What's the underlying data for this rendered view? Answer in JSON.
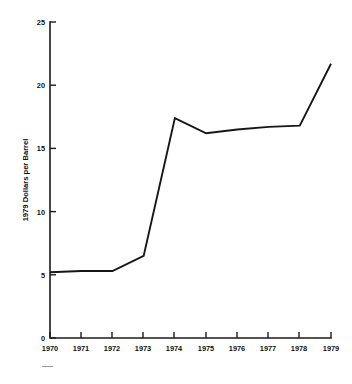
{
  "chart_data": {
    "type": "line",
    "title": "",
    "subtitle": "",
    "xlabel": "",
    "ylabel": "1979 Dollars per Barrel",
    "x": [
      1970,
      1971,
      1972,
      1973,
      1974,
      1975,
      1976,
      1977,
      1978,
      1979
    ],
    "categories": [
      "1970",
      "1971",
      "1972",
      "1973",
      "1974",
      "1975",
      "1976",
      "1977",
      "1978",
      "1979"
    ],
    "values": [
      5.2,
      5.3,
      5.3,
      6.5,
      17.4,
      16.2,
      16.5,
      16.7,
      16.8,
      21.7
    ],
    "series": [
      {
        "name": "1979 Dollars per Barrel",
        "values": [
          5.2,
          5.3,
          5.3,
          6.5,
          17.4,
          16.2,
          16.5,
          16.7,
          16.8,
          21.7
        ]
      }
    ],
    "xlim": [
      1970,
      1979
    ],
    "ylim": [
      0,
      25
    ],
    "ytick_labels": [
      "0",
      "5",
      "10",
      "15",
      "20",
      "25"
    ],
    "ytick_values": [
      0,
      5,
      10,
      15,
      20,
      25
    ],
    "xtick_labels": [
      "1970",
      "1971",
      "1972",
      "1973",
      "1974",
      "1975",
      "1976",
      "1977",
      "1978",
      "1979"
    ],
    "grid": false,
    "legend": false,
    "legend_position": "none",
    "line_color": "#161616",
    "axis_color": "#1c1c1c",
    "background_color": "#ffffff"
  },
  "caption": {
    "fragment": ""
  }
}
